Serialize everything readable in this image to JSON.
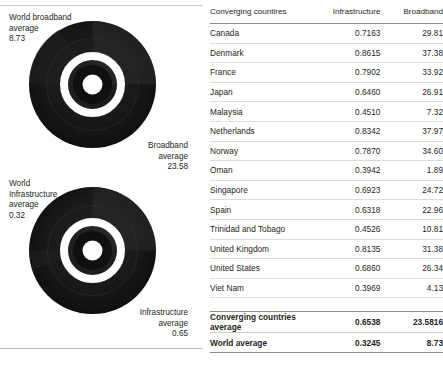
{
  "charts": {
    "broadband": {
      "label_world_title": "World broadband",
      "label_world_sub": "average",
      "label_world_value": "8.73",
      "label_group_title": "Broadband",
      "label_group_sub": "average",
      "label_group_value": "23.58",
      "icon": "donut-chart-icon"
    },
    "infrastructure": {
      "label_world_title": "World",
      "label_world_title2": "Infrastructure",
      "label_world_sub": "average",
      "label_world_value": "0.32",
      "label_group_title": "Infrastructure",
      "label_group_sub": "average",
      "label_group_value": "0.65",
      "icon": "donut-chart-icon"
    }
  },
  "table": {
    "headers": {
      "country": "Converging countires",
      "infrastructure": "Infrastructure",
      "broadband": "Broadband"
    },
    "rows": [
      {
        "country": "Canada",
        "infrastructure": "0.7163",
        "broadband": "29.81"
      },
      {
        "country": "Denmark",
        "infrastructure": "0.8615",
        "broadband": "37.38"
      },
      {
        "country": "France",
        "infrastructure": "0.7902",
        "broadband": "33.92"
      },
      {
        "country": "Japan",
        "infrastructure": "0.6460",
        "broadband": "26.91"
      },
      {
        "country": "Malaysia",
        "infrastructure": "0.4510",
        "broadband": "7.32"
      },
      {
        "country": "Netherlands",
        "infrastructure": "0.8342",
        "broadband": "37.97"
      },
      {
        "country": "Norway",
        "infrastructure": "0.7870",
        "broadband": "34.60"
      },
      {
        "country": "Oman",
        "infrastructure": "0.3942",
        "broadband": "1.89"
      },
      {
        "country": "Singapore",
        "infrastructure": "0.6923",
        "broadband": "24.72"
      },
      {
        "country": "Spain",
        "infrastructure": "0.6318",
        "broadband": "22.96"
      },
      {
        "country": "Trinidad and Tobago",
        "infrastructure": "0.4526",
        "broadband": "10.81"
      },
      {
        "country": "United Kingdom",
        "infrastructure": "0.8135",
        "broadband": "31.38"
      },
      {
        "country": "United States",
        "infrastructure": "0.6860",
        "broadband": "26.34"
      },
      {
        "country": "Viet Nam",
        "infrastructure": "0.3969",
        "broadband": "4.13"
      }
    ],
    "summary": [
      {
        "country": "Converging countries average",
        "infrastructure": "0.6538",
        "broadband": "23.5816"
      },
      {
        "country": "World average",
        "infrastructure": "0.3245",
        "broadband": "8.73"
      }
    ]
  },
  "chart_data": [
    {
      "type": "pie",
      "title": "Broadband average",
      "subtitle": "Converging countries vs world",
      "annotations": [
        {
          "text": "World broadband average",
          "value": 8.73
        },
        {
          "text": "Broadband average",
          "value": 23.58
        }
      ],
      "categories": [
        "Converging countries average",
        "World average"
      ],
      "values": [
        23.58,
        8.73
      ],
      "units": "subscriptions per 100 inhabitants",
      "legend": "none",
      "grid": false
    },
    {
      "type": "pie",
      "title": "Infrastructure average",
      "subtitle": "Converging countries vs world",
      "annotations": [
        {
          "text": "World Infrastructure average",
          "value": 0.32
        },
        {
          "text": "Infrastructure average",
          "value": 0.65
        }
      ],
      "categories": [
        "Converging countries average",
        "World average"
      ],
      "values": [
        0.65,
        0.32
      ],
      "units": "index",
      "legend": "none",
      "grid": false
    },
    {
      "type": "table",
      "title": "Converging countires",
      "columns": [
        "Converging countires",
        "Infrastructure",
        "Broadband"
      ],
      "rows": [
        [
          "Canada",
          0.7163,
          29.81
        ],
        [
          "Denmark",
          0.8615,
          37.38
        ],
        [
          "France",
          0.7902,
          33.92
        ],
        [
          "Japan",
          0.646,
          26.91
        ],
        [
          "Malaysia",
          0.451,
          7.32
        ],
        [
          "Netherlands",
          0.8342,
          37.97
        ],
        [
          "Norway",
          0.787,
          34.6
        ],
        [
          "Oman",
          0.3942,
          1.89
        ],
        [
          "Singapore",
          0.6923,
          24.72
        ],
        [
          "Spain",
          0.6318,
          22.96
        ],
        [
          "Trinidad and Tobago",
          0.4526,
          10.81
        ],
        [
          "United Kingdom",
          0.8135,
          31.38
        ],
        [
          "United States",
          0.686,
          26.34
        ],
        [
          "Viet Nam",
          0.3969,
          4.13
        ]
      ],
      "footer_rows": [
        [
          "Converging countries average",
          0.6538,
          23.5816
        ],
        [
          "World average",
          0.3245,
          8.73
        ]
      ]
    }
  ],
  "colors": {
    "text": "#231f20",
    "rule": "#8c8c8c",
    "row_rule": "#dcdcdc",
    "donut_dark": "#141414",
    "donut_ring": "#ffffff"
  }
}
